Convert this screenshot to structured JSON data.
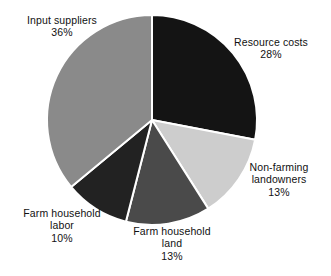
{
  "chart_data": {
    "type": "pie",
    "title": "",
    "subtitle": "",
    "xlabel": "",
    "ylabel": "",
    "legend_position": "none",
    "labels_position": "outside-callout",
    "grid": false,
    "units": "percent",
    "total": 100,
    "start_angle_deg": 0,
    "direction": "clockwise",
    "categories": [
      "Resource costs",
      "Non-farming landowners",
      "Farm household land",
      "Farm household labor",
      "Input suppliers"
    ],
    "values": [
      28,
      13,
      13,
      10,
      36
    ],
    "colors": [
      "#141414",
      "#cdcdcd",
      "#4a4a4a",
      "#222222",
      "#8a8a8a"
    ],
    "slices": [
      {
        "name": "Resource costs",
        "value": 28,
        "value_text": "28%",
        "color": "#141414",
        "label_lines": [
          "Resource costs"
        ],
        "start_deg": 0,
        "end_deg": 100.8
      },
      {
        "name": "Non-farming landowners",
        "value": 13,
        "value_text": "13%",
        "color": "#cdcdcd",
        "label_lines": [
          "Non-farming",
          "landowners"
        ],
        "start_deg": 100.8,
        "end_deg": 147.6
      },
      {
        "name": "Farm household land",
        "value": 13,
        "value_text": "13%",
        "color": "#4a4a4a",
        "label_lines": [
          "Farm household",
          "land"
        ],
        "start_deg": 147.6,
        "end_deg": 194.4
      },
      {
        "name": "Farm household labor",
        "value": 10,
        "value_text": "10%",
        "color": "#222222",
        "label_lines": [
          "Farm household",
          "labor"
        ],
        "start_deg": 194.4,
        "end_deg": 230.4
      },
      {
        "name": "Input suppliers",
        "value": 36,
        "value_text": "36%",
        "color": "#8a8a8a",
        "label_lines": [
          "Input suppliers"
        ],
        "start_deg": 230.4,
        "end_deg": 360
      }
    ]
  },
  "labels": {
    "input_suppliers": {
      "line1": "Input suppliers",
      "pct": "36%"
    },
    "resource_costs": {
      "line1": "Resource costs",
      "pct": "28%"
    },
    "nonfarming_landowners": {
      "line1": "Non-farming",
      "line2": "landowners",
      "pct": "13%"
    },
    "farm_household_labor": {
      "line1": "Farm household",
      "line2": "labor",
      "pct": "10%"
    },
    "farm_household_land": {
      "line1": "Farm household",
      "line2": "land",
      "pct": "13%"
    }
  },
  "figure": {
    "background": "#ffffff",
    "separator_color": "#ffffff",
    "center_x": 152,
    "center_y": 120,
    "radius": 105
  }
}
